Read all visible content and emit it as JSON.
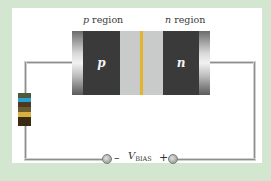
{
  "diagram": {
    "labels": {
      "p_region_prefix": "p",
      "p_region_suffix": " region",
      "n_region_prefix": "n",
      "n_region_suffix": " region",
      "p_letter": "p",
      "n_letter": "n",
      "minus": "–",
      "plus": "+",
      "vbias_main": "V",
      "vbias_sub": "BIAS"
    },
    "colors": {
      "background": "#d3e6cf",
      "panel": "#ffffff",
      "semiconductor": "#3a3a3a",
      "depletion": "#c9cbcb",
      "junction": "#e2b52a",
      "wire": "#8e8e8e"
    },
    "resistor_bands": [
      "#4a5a3a",
      "#2a9fd0",
      "#4a3a22",
      "#6a5a30",
      "#d8b040",
      "#3a2a14",
      "#3a2a14"
    ]
  }
}
